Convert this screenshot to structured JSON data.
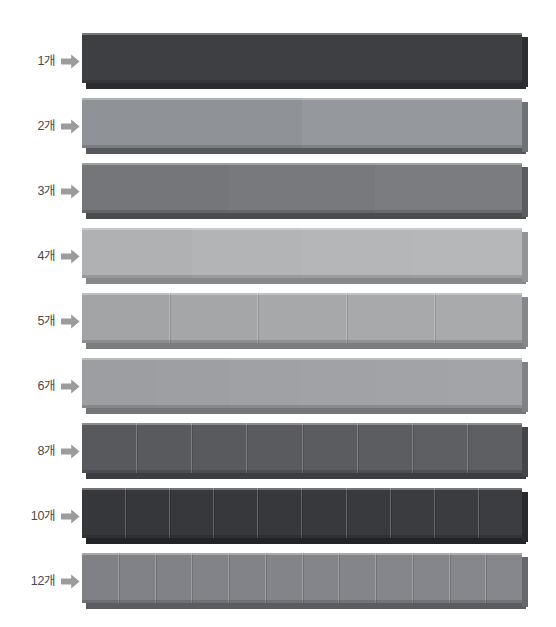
{
  "page": {
    "background_color": "#ffffff",
    "width": 556,
    "height": 627
  },
  "icons": {
    "arrow": "arrow-right-icon",
    "arrow_color": "#9b9b9b"
  },
  "chart_data": {
    "type": "bar",
    "title": "",
    "subtitle": "",
    "xlabel": "",
    "ylabel": "",
    "legend": [],
    "grid": false,
    "note": "Nine equal-length rods; each rod is divided into the number of equal parts given by its label.",
    "categories": [
      "1개",
      "2개",
      "3개",
      "4개",
      "5개",
      "6개",
      "8개",
      "10개",
      "12개"
    ],
    "values": [
      1,
      2,
      3,
      4,
      5,
      6,
      8,
      10,
      12
    ],
    "bar_length_px": 446,
    "rows": [
      {
        "label": "1개",
        "segments": 1,
        "visible_dividers": false,
        "face_color": "#3f4144",
        "side_color": "#2c2e31",
        "bottom_color": "#2a2c2f",
        "top": 33
      },
      {
        "label": "2개",
        "segments": 2,
        "visible_dividers": false,
        "face_color": "#93969a",
        "side_color": "#6e7175",
        "bottom_color": "#55585c",
        "top": 98
      },
      {
        "label": "3개",
        "segments": 3,
        "visible_dividers": false,
        "face_color": "#77797d",
        "side_color": "#5a5c60",
        "bottom_color": "#4a4c50",
        "top": 163
      },
      {
        "label": "4개",
        "segments": 4,
        "visible_dividers": false,
        "face_color": "#b4b6b8",
        "side_color": "#929496",
        "bottom_color": "#86888a",
        "top": 228
      },
      {
        "label": "5개",
        "segments": 5,
        "visible_dividers": true,
        "face_color": "#a6a8aa",
        "side_color": "#85878a",
        "bottom_color": "#7a7c7e",
        "top": 293
      },
      {
        "label": "6개",
        "segments": 6,
        "visible_dividers": false,
        "face_color": "#a0a2a5",
        "side_color": "#7f8184",
        "bottom_color": "#74767a",
        "top": 358
      },
      {
        "label": "8개",
        "segments": 8,
        "visible_dividers": true,
        "face_color": "#5a5c60",
        "side_color": "#434549",
        "bottom_color": "#3b3d41",
        "top": 423
      },
      {
        "label": "10개",
        "segments": 10,
        "visible_dividers": true,
        "face_color": "#37393c",
        "side_color": "#27292c",
        "bottom_color": "#222427",
        "top": 488
      },
      {
        "label": "12개",
        "segments": 12,
        "visible_dividers": true,
        "face_color": "#83858a",
        "side_color": "#65676b",
        "bottom_color": "#5a5c60",
        "top": 553
      }
    ]
  }
}
